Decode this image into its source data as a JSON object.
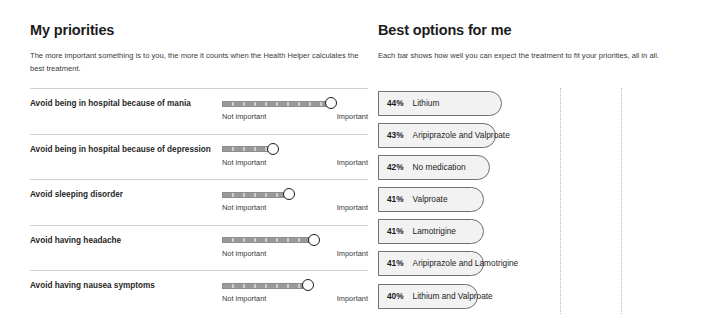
{
  "priorities_panel": {
    "title": "My priorities",
    "subtitle": "The more important something is to you, the more it counts when the Health Helper calculates the best treatment.",
    "scale": {
      "min_label": "Not important",
      "max_label": "Important"
    },
    "items": [
      {
        "label": "Avoid being in hospital because of mania",
        "value": 92
      },
      {
        "label": "Avoid being in hospital because of depression",
        "value": 43
      },
      {
        "label": "Avoid sleeping disorder",
        "value": 57
      },
      {
        "label": "Avoid having headache",
        "value": 78
      },
      {
        "label": "Avoid having nausea symptoms",
        "value": 73
      }
    ]
  },
  "results_panel": {
    "title": "Best options for me",
    "subtitle": "Each bar shows how well you can expect the treatment to fit your priorities, all in all."
  },
  "chart_data": {
    "type": "bar",
    "title": "Best options for me",
    "xlabel": "",
    "ylabel": "",
    "xlim": [
      0,
      100
    ],
    "grid": true,
    "orientation": "horizontal",
    "unit": "%",
    "gridlines": [
      57,
      76
    ],
    "categories": [
      "Lithium",
      "Aripiprazole and Valproate",
      "No medication",
      "Valproate",
      "Lamotrigine",
      "Aripiprazole and Lamotrigine",
      "Lithium and Valproate"
    ],
    "values": [
      44,
      43,
      42,
      41,
      41,
      41,
      40
    ],
    "labels": [
      "44%",
      "43%",
      "42%",
      "41%",
      "41%",
      "41%",
      "40%"
    ]
  }
}
